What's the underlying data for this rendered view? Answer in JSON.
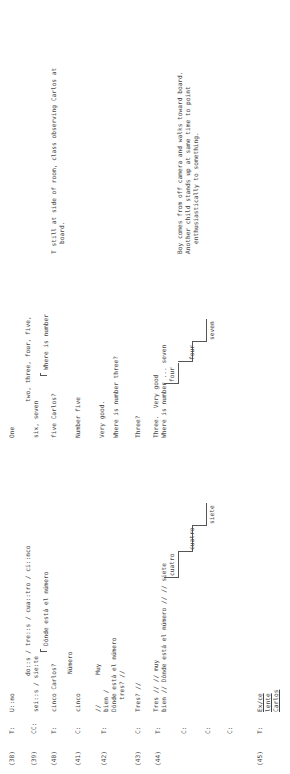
{
  "lines": [
    {
      "num": "(38)",
      "speaker": "T:",
      "spanish": [
        "U::no"
      ],
      "english": [
        "One"
      ],
      "notes": []
    },
    {
      "num": "(39)",
      "speaker": "CC:",
      "spanish": [
        "do::s / tre::s / cua::tro / ci::nco",
        "sei::s / sie:te"
      ],
      "english": [
        "two, three, four, five,",
        "six, seven"
      ],
      "notes": []
    },
    {
      "num": "(40)",
      "speaker": "T:",
      "spanish": [
        "Dónde está el número",
        "cinco Carlos?"
      ],
      "english": [
        "Where is number",
        "five Carlos?"
      ],
      "notes": [
        "T still at side of room, class observing Carlos at",
        "board."
      ]
    },
    {
      "num": "(41)",
      "speaker": "C:",
      "spanish": [
        "Número",
        "cinco"
      ],
      "english": [
        "Number five"
      ],
      "notes": []
    },
    {
      "num": "(42)",
      "speaker": "T:",
      "spanish": [
        "//        Muy",
        "bien /",
        "Dónde está el número",
        "tres? //"
      ],
      "english": [
        "Very good.",
        "Where is number three?"
      ],
      "notes": []
    },
    {
      "num": "(43)",
      "speaker": "C:",
      "spanish": [
        "Tres? //"
      ],
      "english": [
        "Three?"
      ],
      "notes": []
    },
    {
      "num": "(44)",
      "speaker": "T:",
      "spanish": [
        "Tres // // muy",
        "bien // Dónde está el número // // siete"
      ],
      "english": [
        "Three.  Very good",
        "Where is number ... seven"
      ],
      "notes": [
        "Boy comes from off camera and walks toward board.",
        "Another child stands up at same time to point",
        "enthusiastically to something."
      ]
    },
    {
      "num": "",
      "speaker": "C:",
      "spanish": [
        "cuatro"
      ],
      "english": [
        "four"
      ],
      "notes": []
    },
    {
      "num": "",
      "speaker": "C:",
      "spanish": [
        "cuatro"
      ],
      "english": [
        "four"
      ],
      "notes": []
    },
    {
      "num": "",
      "speaker": "C:",
      "spanish": [
        "siete"
      ],
      "english": [
        "seven"
      ],
      "notes": []
    },
    {
      "num": "(45)",
      "speaker": "T:",
      "spanish": [
        "Ex/ce",
        "lente",
        "Carlos"
      ],
      "english": [],
      "notes": []
    }
  ]
}
